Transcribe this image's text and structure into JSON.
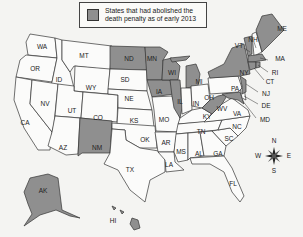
{
  "legend": {
    "label": "States that had abolished the death penalty as of early 2013",
    "label_line1": "States that had abolished the",
    "label_line2": "death penalty as of early 2013",
    "swatch_color": "#8f8f8f"
  },
  "colors": {
    "abolished": "#8f8f8f",
    "not_abolished": "#fbfbfa",
    "border": "#333333"
  },
  "abolished_states": [
    "ND",
    "MN",
    "WI",
    "IA",
    "MI",
    "IL",
    "NM",
    "NY",
    "VT",
    "ME",
    "MA",
    "RI",
    "CT",
    "NJ",
    "WV",
    "MD",
    "AK",
    "HI"
  ],
  "state_labels": {
    "WA": "WA",
    "OR": "OR",
    "CA": "CA",
    "ID": "ID",
    "NV": "NV",
    "MT": "MT",
    "WY": "WY",
    "UT": "UT",
    "AZ": "AZ",
    "CO": "CO",
    "NM": "NM",
    "ND": "ND",
    "SD": "SD",
    "NE": "NE",
    "KS": "KS",
    "OK": "OK",
    "TX": "TX",
    "MN": "MN",
    "IA": "IA",
    "MO": "MO",
    "AR": "AR",
    "LA": "LA",
    "WI": "WI",
    "IL": "IL",
    "MI": "MI",
    "IN": "IN",
    "OH": "OH",
    "KY": "KY",
    "TN": "TN",
    "MS": "MS",
    "AL": "AL",
    "GA": "GA",
    "FL": "FL",
    "SC": "SC",
    "NC": "NC",
    "VA": "VA",
    "WV": "WV",
    "PA": "PA",
    "NY": "NY",
    "VT": "VT",
    "NH": "NH",
    "ME": "ME",
    "MA": "MA",
    "RI": "RI",
    "CT": "CT",
    "NJ": "NJ",
    "DE": "DE",
    "MD": "MD",
    "AK": "AK",
    "HI": "HI"
  },
  "compass": {
    "n": "N",
    "s": "S",
    "e": "E",
    "w": "W"
  }
}
